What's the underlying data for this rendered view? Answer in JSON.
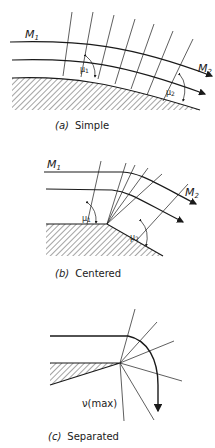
{
  "panels": [
    {
      "id": "a",
      "caption_letter": "(a)",
      "caption_text": "Simple",
      "label_upstream": "M",
      "label_upstream_sub": "1",
      "label_downstream": "M",
      "label_downstream_sub": "2",
      "angle_1": "μ",
      "angle_1_sub": "1",
      "angle_2": "μ",
      "angle_2_sub": "2"
    },
    {
      "id": "b",
      "caption_letter": "(b)",
      "caption_text": "Centered",
      "label_upstream": "M",
      "label_upstream_sub": "1",
      "label_downstream": "M",
      "label_downstream_sub": "2",
      "angle_1": "μ",
      "angle_1_sub": "1",
      "angle_2": "μ",
      "angle_2_sub": "2"
    },
    {
      "id": "c",
      "caption_letter": "(c)",
      "caption_text": "Separated",
      "annotation": "ν(max)"
    }
  ],
  "colors": {
    "ink": "#1a1a1a",
    "background": "#ffffff"
  }
}
